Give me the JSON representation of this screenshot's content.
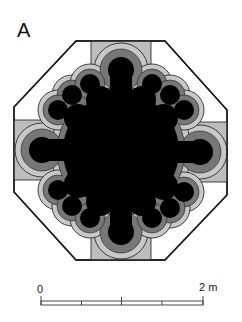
{
  "figure": {
    "panel_label": "A",
    "colors": {
      "outline": "#1a1a1a",
      "background": "#ffffff",
      "arm_fill": "#bdbdbd",
      "outer_band": "#c8c8c8",
      "middle_band": "#777777",
      "core": "#000000"
    }
  },
  "scale_bar": {
    "start_label": "0",
    "end_label": "2 m",
    "divisions": 4
  }
}
